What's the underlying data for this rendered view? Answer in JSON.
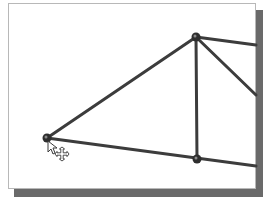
{
  "viewport": {
    "description": "truss sketch in graphics area",
    "colors": {
      "background": "#ffffff",
      "frame_border": "#b8b8b8",
      "shadow": "#6a6a6a",
      "member": "#3c3c3c",
      "node": "#2e2e2e"
    }
  },
  "truss": {
    "nodes": [
      {
        "id": "left-node",
        "x": 47,
        "y": 138
      },
      {
        "id": "top-node",
        "x": 196,
        "y": 37
      },
      {
        "id": "bottom-node",
        "x": 197,
        "y": 159
      }
    ],
    "members": [
      {
        "id": "member-left-top",
        "x1": 47,
        "y1": 138,
        "x2": 196,
        "y2": 37
      },
      {
        "id": "member-left-bottom",
        "x1": 47,
        "y1": 138,
        "x2": 256,
        "y2": 166
      },
      {
        "id": "member-vertical",
        "x1": 196,
        "y1": 37,
        "x2": 197,
        "y2": 159
      },
      {
        "id": "member-top-right",
        "x1": 196,
        "y1": 37,
        "x2": 256,
        "y2": 45
      },
      {
        "id": "member-diagonal-right",
        "x1": 196,
        "y1": 37,
        "x2": 256,
        "y2": 95
      }
    ]
  },
  "cursor": {
    "icon": "arrow-move-cursor-icon",
    "x": 48,
    "y": 141
  }
}
